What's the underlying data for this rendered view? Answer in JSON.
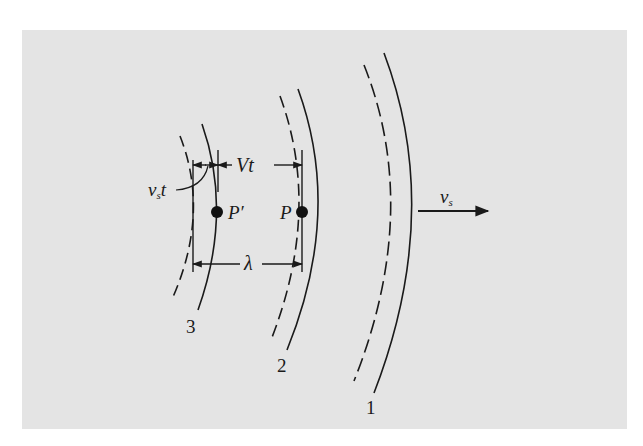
{
  "figure": {
    "background_color": "#e4e4e4",
    "ink_color": "#1a1a1a",
    "wavefronts": [
      {
        "id": "1",
        "label": "1",
        "style": "solid-with-dashed-predecessor"
      },
      {
        "id": "2",
        "label": "2",
        "style": "solid-with-dashed-predecessor"
      },
      {
        "id": "3",
        "label": "3",
        "style": "solid-with-dashed-predecessor"
      }
    ],
    "points": [
      {
        "id": "P",
        "label": "P"
      },
      {
        "id": "P-prime",
        "label": "P′"
      }
    ],
    "dimensions": {
      "vt_label": "Vt",
      "vst_label_main": "v",
      "vst_label_sub": "s",
      "vst_label_t": "t",
      "lambda_label": "λ"
    },
    "velocity": {
      "label_main": "v",
      "label_sub": "s"
    }
  }
}
